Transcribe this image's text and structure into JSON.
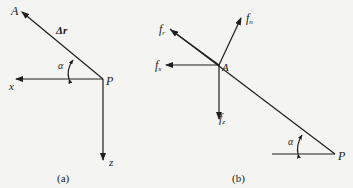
{
  "panels": [
    {
      "id": "a",
      "caption": "(a)",
      "points": {
        "A": "A",
        "P": "P"
      },
      "vector_label": "Δr",
      "angle_label": "α",
      "axes": {
        "x": "x",
        "z": "z"
      }
    },
    {
      "id": "b",
      "caption": "(b)",
      "points": {
        "A": "A",
        "P": "P"
      },
      "angle_label": "α",
      "forces": {
        "fr": {
          "base": "f",
          "sub": "r"
        },
        "fn": {
          "base": "f",
          "sub": "n"
        },
        "fx": {
          "base": "f",
          "sub": "x"
        },
        "fz": {
          "base": "f",
          "sub": "z"
        }
      }
    }
  ],
  "colors": {
    "line": "#1e1e1e",
    "background": "#f4f4f2"
  }
}
